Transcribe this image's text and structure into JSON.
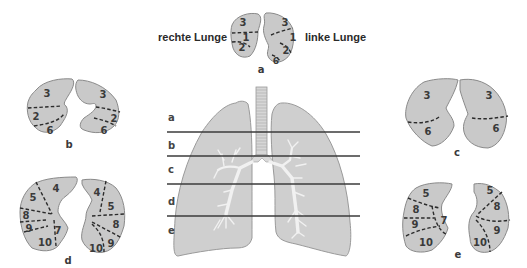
{
  "figure": {
    "labels": {
      "right_lung": "rechte Lunge",
      "left_lung": "linke Lunge"
    },
    "levels": [
      "a",
      "b",
      "c",
      "d",
      "e"
    ],
    "sections": {
      "a": {
        "caption": "a",
        "right": [
          "3",
          "1",
          "2"
        ],
        "left": [
          "3",
          "1",
          "2",
          "6"
        ]
      },
      "b": {
        "caption": "b",
        "right": [
          "3",
          "2",
          "6"
        ],
        "left": [
          "3",
          "2",
          "6"
        ]
      },
      "c": {
        "caption": "c",
        "right": [
          "3",
          "6"
        ],
        "left": [
          "3",
          "6"
        ]
      },
      "d": {
        "caption": "d",
        "right": [
          "4",
          "5",
          "8",
          "9",
          "7",
          "10"
        ],
        "left": [
          "4",
          "5",
          "8",
          "9",
          "10"
        ]
      },
      "e": {
        "caption": "e",
        "right": [
          "5",
          "8",
          "9",
          "7",
          "10"
        ],
        "left": [
          "5",
          "8",
          "9",
          "10"
        ]
      }
    },
    "colors": {
      "lung_fill": "#cfcfcf",
      "outline": "#9a9a9a",
      "segment_line": "#2b2b2b",
      "text": "#3a3a3a",
      "bronchi": "#f1f1f1"
    }
  }
}
